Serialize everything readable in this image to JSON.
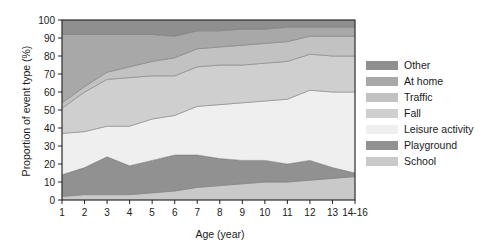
{
  "chart_data": {
    "type": "area",
    "title": "",
    "xlabel": "Age (year)",
    "ylabel": "Proportion of event type (%)",
    "categories": [
      "1",
      "2",
      "3",
      "4",
      "5",
      "6",
      "7",
      "8",
      "9",
      "10",
      "11",
      "12",
      "13",
      "14-16"
    ],
    "xtick_labels": [
      "1",
      "2",
      "3",
      "4",
      "5",
      "6",
      "7",
      "8",
      "9",
      "10",
      "11",
      "12",
      "13",
      "14-16"
    ],
    "ytick_labels": [
      "0",
      "10",
      "20",
      "30",
      "40",
      "50",
      "60",
      "70",
      "80",
      "90",
      "100"
    ],
    "ylim": [
      0,
      100
    ],
    "yticks": [
      0,
      10,
      20,
      30,
      40,
      50,
      60,
      70,
      80,
      90,
      100
    ],
    "grid": false,
    "stacked": true,
    "legend_position": "right",
    "stack_order_bottom_to_top": [
      "School",
      "Playground",
      "Leisure activity",
      "Fall",
      "Traffic",
      "At home",
      "Other"
    ],
    "series": [
      {
        "name": "School",
        "color": "#c9c9c9",
        "values": [
          2,
          3,
          3,
          3,
          4,
          5,
          7,
          8,
          9,
          10,
          10,
          11,
          12,
          13
        ]
      },
      {
        "name": "Playground",
        "color": "#919191",
        "values": [
          12,
          15,
          21,
          16,
          18,
          20,
          18,
          15,
          13,
          12,
          10,
          11,
          6,
          2
        ]
      },
      {
        "name": "Leisure activity",
        "color": "#efefef",
        "values": [
          23,
          20,
          17,
          22,
          23,
          22,
          27,
          30,
          32,
          33,
          36,
          39,
          42,
          45
        ]
      },
      {
        "name": "Fall",
        "color": "#cfcfcf",
        "values": [
          14,
          22,
          26,
          27,
          24,
          22,
          22,
          22,
          21,
          21,
          21,
          20,
          20,
          20
        ]
      },
      {
        "name": "Traffic",
        "color": "#c2c2c2",
        "values": [
          3,
          3,
          4,
          6,
          8,
          10,
          10,
          10,
          11,
          11,
          11,
          10,
          11,
          11
        ]
      },
      {
        "name": "At home",
        "color": "#a8a8a8",
        "values": [
          38,
          29,
          21,
          18,
          15,
          12,
          10,
          9,
          9,
          8,
          8,
          5,
          5,
          5
        ]
      },
      {
        "name": "Other",
        "color": "#8f8f8f",
        "values": [
          8,
          8,
          8,
          8,
          8,
          9,
          6,
          6,
          5,
          5,
          4,
          4,
          4,
          4
        ]
      }
    ],
    "legend_entries": [
      {
        "label": "Other",
        "color": "#8f8f8f"
      },
      {
        "label": "At home",
        "color": "#a8a8a8"
      },
      {
        "label": "Traffic",
        "color": "#c2c2c2"
      },
      {
        "label": "Fall",
        "color": "#cfcfcf"
      },
      {
        "label": "Leisure activity",
        "color": "#efefef"
      },
      {
        "label": "Playground",
        "color": "#919191"
      },
      {
        "label": "School",
        "color": "#c9c9c9"
      }
    ]
  }
}
